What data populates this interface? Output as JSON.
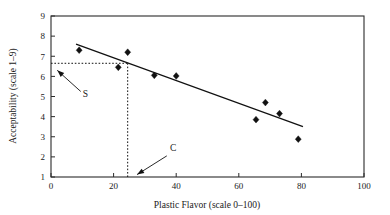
{
  "chart_data": {
    "type": "scatter",
    "title": "",
    "xlabel": "Plastic Flavor (scale 0–100)",
    "ylabel": "Acceptability (scale 1–9)",
    "xlim": [
      0,
      100
    ],
    "ylim": [
      1,
      9
    ],
    "xticks": [
      0,
      20,
      40,
      60,
      80,
      100
    ],
    "yticks": [
      1,
      2,
      3,
      4,
      5,
      6,
      7,
      8,
      9
    ],
    "xtick_labels": [
      "0",
      "20",
      "40",
      "60",
      "80",
      "100"
    ],
    "ytick_labels": [
      "1",
      "2",
      "3",
      "4",
      "5",
      "6",
      "7",
      "8",
      "9"
    ],
    "grid": false,
    "legend": null,
    "series": [
      {
        "name": "samples",
        "marker": "diamond",
        "color": "#111111",
        "points": [
          {
            "x": 9.0,
            "y": 7.3
          },
          {
            "x": 21.5,
            "y": 6.45
          },
          {
            "x": 24.5,
            "y": 7.2
          },
          {
            "x": 33.0,
            "y": 6.05
          },
          {
            "x": 40.0,
            "y": 6.02
          },
          {
            "x": 65.5,
            "y": 3.85
          },
          {
            "x": 68.5,
            "y": 4.7
          },
          {
            "x": 73.0,
            "y": 4.15
          },
          {
            "x": 79.0,
            "y": 2.88
          }
        ]
      }
    ],
    "fit_line": {
      "name": "regression-line",
      "x_start": 8.0,
      "y_start": 7.6,
      "x_end": 80.5,
      "y_end": 3.5,
      "color": "#111111"
    },
    "reference_lines": [
      {
        "name": "horizontal-cutoff",
        "orientation": "horizontal",
        "value": 6.65,
        "x_from": 0.0,
        "x_to": 24.5,
        "style": "dotted"
      },
      {
        "name": "vertical-cutoff",
        "orientation": "vertical",
        "value": 24.5,
        "y_from": 1.0,
        "y_to": 6.65,
        "style": "dotted"
      }
    ],
    "annotations": [
      {
        "label": "S",
        "label_x": 11.0,
        "label_y": 4.96,
        "arrow_from_x": 9.5,
        "arrow_from_y": 5.25,
        "arrow_to_x": 2.0,
        "arrow_to_y": 6.3
      },
      {
        "label": "C",
        "label_x": 39.0,
        "label_y": 2.3,
        "arrow_from_x": 37.0,
        "arrow_from_y": 2.05,
        "arrow_to_x": 27.5,
        "arrow_to_y": 1.12
      }
    ]
  }
}
